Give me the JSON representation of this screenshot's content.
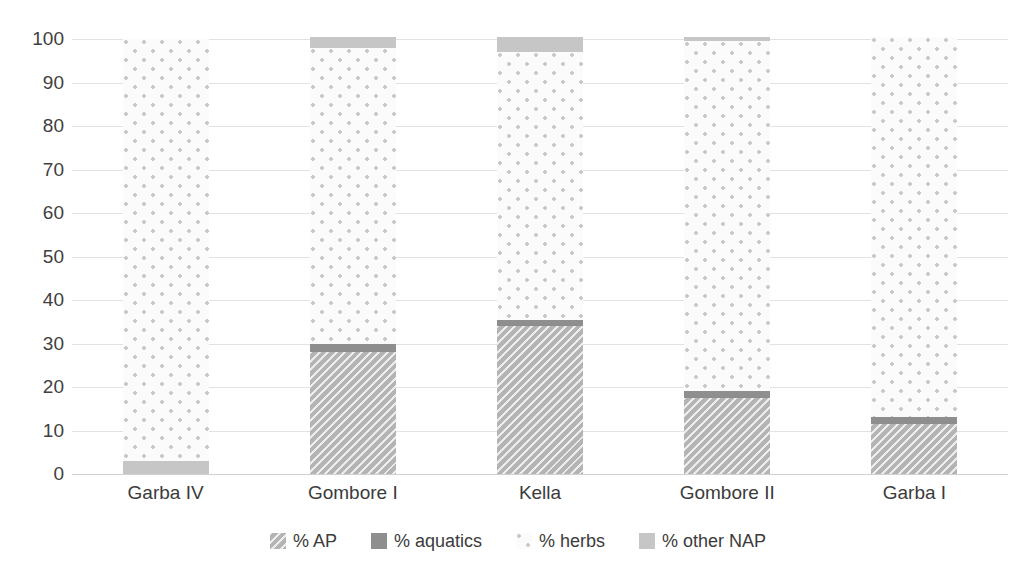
{
  "chart_data": {
    "type": "bar",
    "variant": "stacked-bar",
    "title": "",
    "subtitle": "",
    "xlabel": "",
    "ylabel": "",
    "ylim": [
      0,
      100
    ],
    "ytick_step": 10,
    "yticks": [
      "100",
      "90",
      "80",
      "70",
      "60",
      "50",
      "40",
      "30",
      "20",
      "10",
      "0"
    ],
    "grid": true,
    "grid_axis": "y",
    "legend_position": "bottom",
    "categories": [
      "Garba IV",
      "Gombore I",
      "Kella",
      "Gombore II",
      "Garba I"
    ],
    "series": [
      {
        "name": "% AP",
        "pattern": "diagonal-hatch",
        "color": "#b4b4b4",
        "values": [
          0,
          28,
          34,
          17.5,
          11.5
        ]
      },
      {
        "name": "% aquatics",
        "pattern": "solid-dark",
        "color": "#8e8e8e",
        "values": [
          0,
          2,
          1.5,
          1.5,
          1.5
        ]
      },
      {
        "name": "% herbs",
        "pattern": "dotted-light",
        "color": "#fbfbfb",
        "values": [
          97,
          68,
          61.5,
          80.5,
          87.5
        ]
      },
      {
        "name": "% other NAP",
        "pattern": "solid-light",
        "color": "#c6c6c6",
        "values": [
          3,
          2.5,
          3.5,
          1,
          0
        ]
      }
    ]
  },
  "legend": {
    "items": [
      {
        "label": "% AP",
        "swatch": "ap-swatch-icon"
      },
      {
        "label": "% aquatics",
        "swatch": "aquatics-swatch-icon"
      },
      {
        "label": "% herbs",
        "swatch": "herbs-swatch-icon"
      },
      {
        "label": "% other NAP",
        "swatch": "other-nap-swatch-icon"
      }
    ]
  }
}
